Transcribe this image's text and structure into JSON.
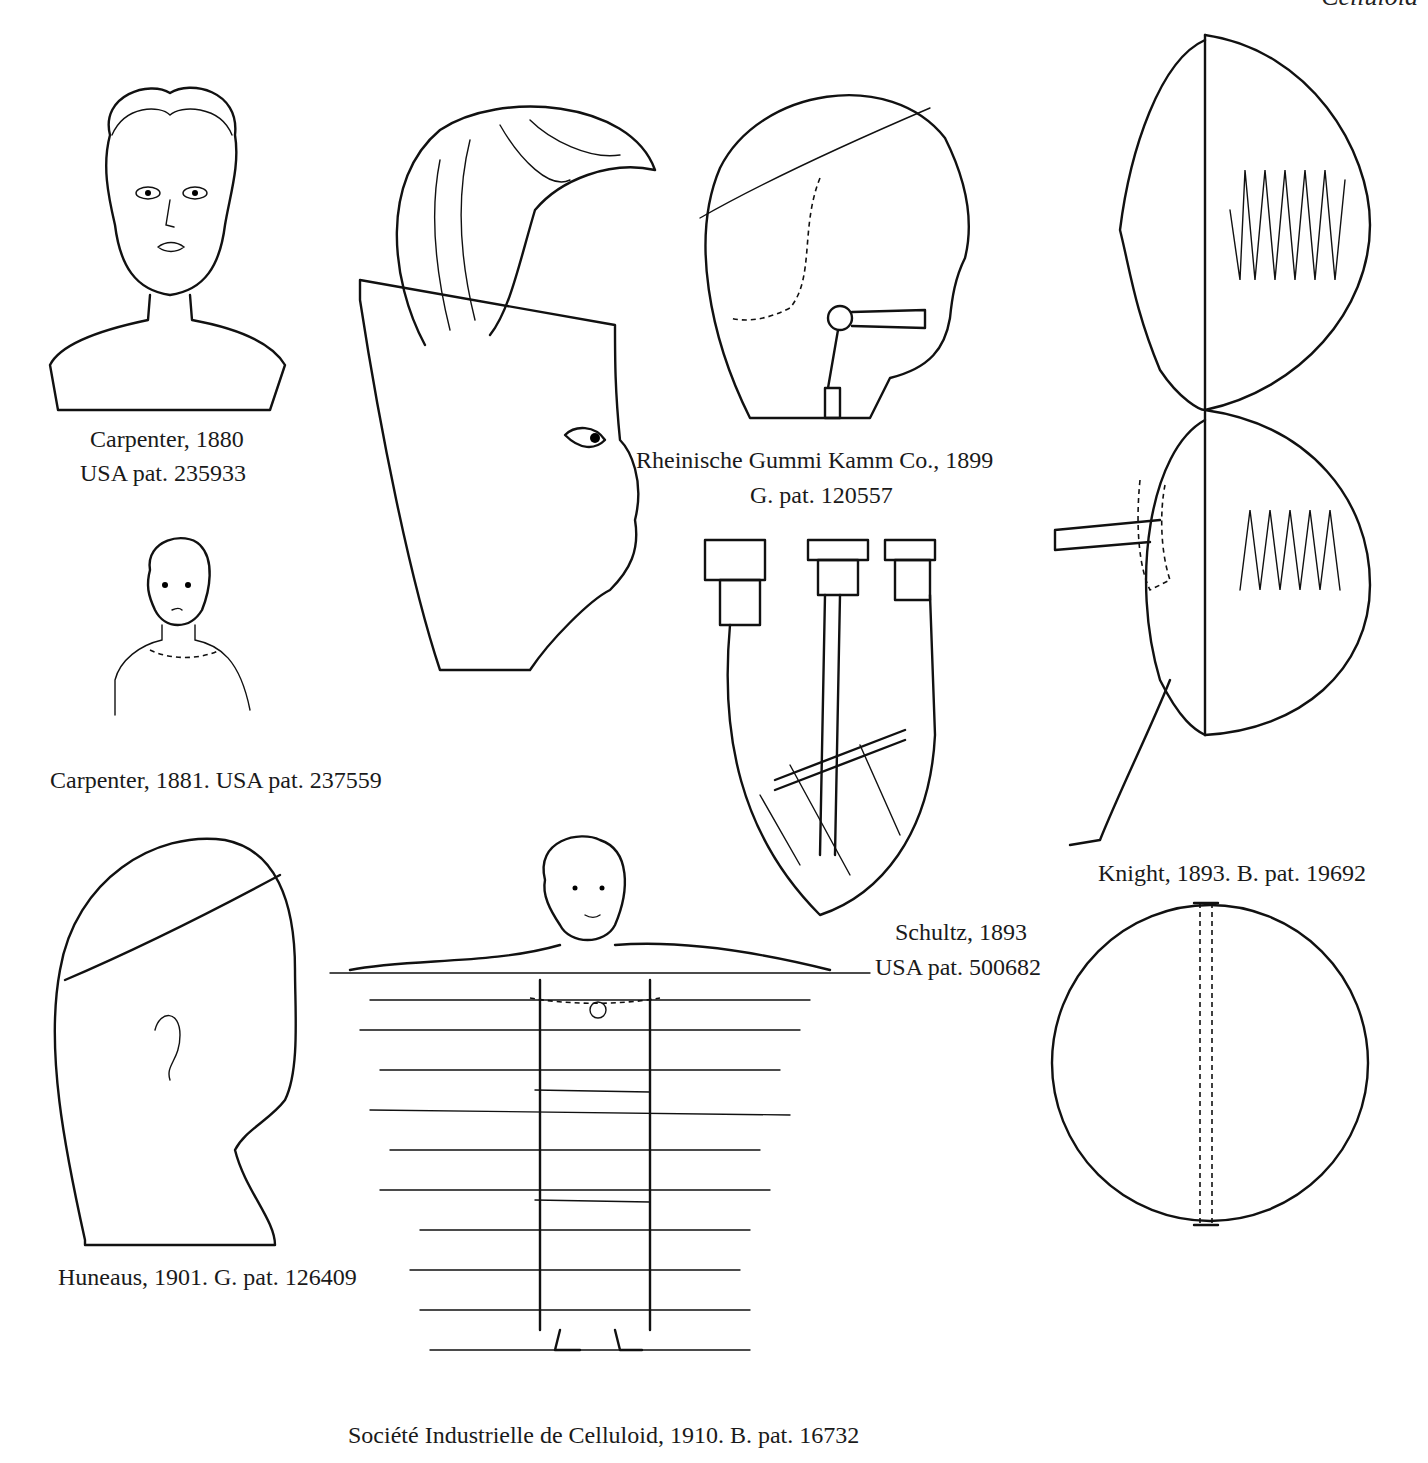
{
  "page": {
    "header_fragment": "Celluloid",
    "captions": {
      "carpenter_1880_line1": "Carpenter, 1880",
      "carpenter_1880_line2": "USA pat. 235933",
      "carpenter_1881": "Carpenter, 1881. USA pat. 237559",
      "rheinische_line1": "Rheinische Gummi Kamm Co., 1899",
      "rheinische_line2": "G. pat. 120557",
      "knight": "Knight, 1893. B. pat. 19692",
      "schultz_line1": "Schultz, 1893",
      "schultz_line2": "USA pat. 500682",
      "huneaus": "Huneaus, 1901. G. pat. 126409",
      "societe": "Société Industrielle de Celluloid, 1910. B. pat. 16732"
    },
    "figures": [
      {
        "id": "carpenter-1880-bust",
        "desc": "woman's head and shoulders bust"
      },
      {
        "id": "carpenter-1881-doll",
        "desc": "small doll bust"
      },
      {
        "id": "wig-and-face-mask",
        "desc": "hair piece above profile face mask"
      },
      {
        "id": "rheinische-head",
        "desc": "doll head profile with eye mechanism"
      },
      {
        "id": "schultz-head-section",
        "desc": "inverted head cross-section with rods"
      },
      {
        "id": "knight-ball-doll",
        "desc": "spherical doll with profile face and spring"
      },
      {
        "id": "knight-sphere",
        "desc": "sphere with dashed central joint"
      },
      {
        "id": "huneaus-head",
        "desc": "child head profile with band"
      },
      {
        "id": "societe-swimmer",
        "desc": "doll figure with arms outstretched over horizontal lines"
      }
    ]
  }
}
